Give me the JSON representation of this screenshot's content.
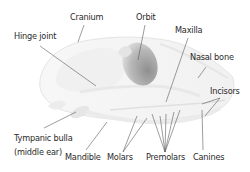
{
  "diagram": {
    "colors": {
      "background": "#ffffff",
      "skull_fill": "#f4f4f4",
      "skull_edge": "#e2e2e2",
      "orbit_dark": "#9a9a9a",
      "orbit_light": "#e0e0e0",
      "leader_line": "#555555",
      "label_text": "#2a2a2a"
    },
    "labels": {
      "cranium": "Cranium",
      "orbit": "Orbit",
      "maxilla": "Maxilla",
      "hinge_joint": "Hinge joint",
      "nasal_bone": "Nasal bone",
      "incisors": "Incisors",
      "tympanic_bulla": "Tympanic bulla",
      "tympanic_bulla_note": "(middle ear)",
      "mandible": "Mandible",
      "molars": "Molars",
      "premolars": "Premolars",
      "canines": "Canines"
    }
  }
}
